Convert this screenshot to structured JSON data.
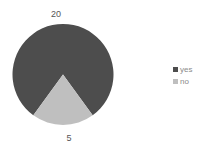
{
  "chart_data": {
    "type": "pie",
    "title": "",
    "categories": [
      "yes",
      "no"
    ],
    "values": [
      20,
      5
    ],
    "data_labels": [
      "20",
      "5"
    ],
    "colors": [
      "#4d4d4d",
      "#bfbfbf"
    ],
    "legend": {
      "position": "right",
      "entries": [
        "yes",
        "no"
      ]
    },
    "start_angle_deg": 216
  },
  "legend": {
    "items": [
      {
        "label": "yes",
        "color": "#4d4d4d"
      },
      {
        "label": "no",
        "color": "#bfbfbf"
      }
    ]
  },
  "labels": {
    "yes": "20",
    "no": "5"
  }
}
